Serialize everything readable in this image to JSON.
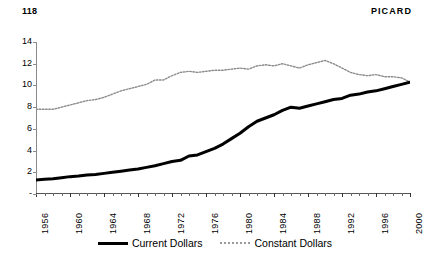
{
  "running_head": {
    "folio": "118",
    "title": "PICARD"
  },
  "chart_data": {
    "type": "line",
    "title": "",
    "subtitle": "",
    "xlabel": "",
    "ylabel": "",
    "xlim": [
      1956,
      2000
    ],
    "ylim": [
      0,
      14
    ],
    "grid": false,
    "legend_position": "bottom",
    "y_ticks": [
      "-",
      "2",
      "4",
      "6",
      "8",
      "10",
      "12",
      "14"
    ],
    "y_tick_values": [
      0,
      2,
      4,
      6,
      8,
      10,
      12,
      14
    ],
    "x_ticks": [
      "1956",
      "1960",
      "1964",
      "1968",
      "1972",
      "1976",
      "1980",
      "1984",
      "1988",
      "1992",
      "1996",
      "2000"
    ],
    "x_tick_values": [
      1956,
      1960,
      1964,
      1968,
      1972,
      1976,
      1980,
      1984,
      1988,
      1992,
      1996,
      2000
    ],
    "x": [
      1956,
      1957,
      1958,
      1959,
      1960,
      1961,
      1962,
      1963,
      1964,
      1965,
      1966,
      1967,
      1968,
      1969,
      1970,
      1971,
      1972,
      1973,
      1974,
      1975,
      1976,
      1977,
      1978,
      1979,
      1980,
      1981,
      1982,
      1983,
      1984,
      1985,
      1986,
      1987,
      1988,
      1989,
      1990,
      1991,
      1992,
      1993,
      1994,
      1995,
      1996,
      1997,
      1998,
      1999,
      2000
    ],
    "series": [
      {
        "name": "Current Dollars",
        "style": "solid",
        "color": "#000000",
        "width": 3,
        "values": [
          1.3,
          1.35,
          1.4,
          1.5,
          1.6,
          1.65,
          1.75,
          1.8,
          1.9,
          2.0,
          2.1,
          2.2,
          2.3,
          2.45,
          2.6,
          2.8,
          3.0,
          3.1,
          3.5,
          3.6,
          3.9,
          4.2,
          4.6,
          5.1,
          5.6,
          6.2,
          6.7,
          7.0,
          7.3,
          7.7,
          8.0,
          7.9,
          8.1,
          8.3,
          8.5,
          8.7,
          8.8,
          9.1,
          9.2,
          9.4,
          9.5,
          9.7,
          9.9,
          10.1,
          10.3
        ]
      },
      {
        "name": "Constant Dollars",
        "style": "dotted",
        "color": "#8c8c8c",
        "width": 1.4,
        "values": [
          7.8,
          7.8,
          7.8,
          8.0,
          8.2,
          8.4,
          8.6,
          8.7,
          8.9,
          9.2,
          9.5,
          9.7,
          9.9,
          10.1,
          10.5,
          10.5,
          10.9,
          11.2,
          11.3,
          11.2,
          11.3,
          11.4,
          11.4,
          11.5,
          11.6,
          11.5,
          11.8,
          11.9,
          11.8,
          12.0,
          11.8,
          11.6,
          11.9,
          12.1,
          12.3,
          12.0,
          11.6,
          11.2,
          11.0,
          10.9,
          11.0,
          10.8,
          10.8,
          10.7,
          10.3
        ]
      }
    ],
    "legend": [
      "Current Dollars",
      "Constant Dollars"
    ]
  }
}
